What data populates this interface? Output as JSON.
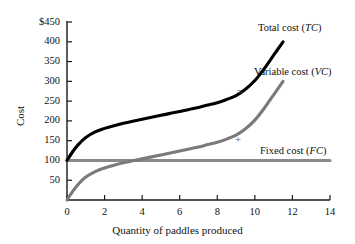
{
  "chart_data": {
    "type": "line",
    "title": "",
    "xlabel": "Quantity of paddles produced",
    "ylabel": "Cost",
    "xlim": [
      0,
      14
    ],
    "ylim": [
      0,
      450
    ],
    "grid": false,
    "legend_position": "inline-right",
    "x_ticks": [
      "0",
      "2",
      "4",
      "6",
      "8",
      "10",
      "12",
      "14"
    ],
    "x_tick_values": [
      0,
      2,
      4,
      6,
      8,
      10,
      12,
      14
    ],
    "y_ticks": [
      "50",
      "100",
      "150",
      "200",
      "250",
      "300",
      "350",
      "400",
      "$450"
    ],
    "y_tick_values": [
      50,
      100,
      150,
      200,
      250,
      300,
      350,
      400,
      450
    ],
    "series": [
      {
        "name": "Total cost (TC)",
        "abbr": "TC",
        "color": "#000000",
        "width": 3.1,
        "x": [
          0,
          0.3,
          0.6,
          1.0,
          1.5,
          2.0,
          2.5,
          3.0,
          3.5,
          4.0,
          4.5,
          5.0,
          5.5,
          6.0,
          6.5,
          7.0,
          7.5,
          8.0,
          8.5,
          9.0,
          9.5,
          10.0,
          10.5,
          11.0,
          11.5
        ],
        "values": [
          100,
          122,
          140,
          158,
          172,
          181,
          188,
          194,
          199,
          204,
          209,
          214,
          219,
          224,
          229,
          234,
          240,
          246,
          254,
          264,
          280,
          302,
          332,
          366,
          400
        ]
      },
      {
        "name": "Variable cost (VC)",
        "abbr": "VC",
        "color": "#7a7a7a",
        "width": 3.1,
        "x": [
          0,
          0.3,
          0.6,
          1.0,
          1.5,
          2.0,
          2.5,
          3.0,
          3.5,
          4.0,
          4.5,
          5.0,
          5.5,
          6.0,
          6.5,
          7.0,
          7.5,
          8.0,
          8.5,
          9.0,
          9.5,
          10.0,
          10.5,
          11.0,
          11.5
        ],
        "values": [
          0,
          22,
          40,
          58,
          72,
          81,
          88,
          94,
          99,
          104,
          109,
          114,
          119,
          124,
          129,
          134,
          140,
          146,
          154,
          164,
          180,
          202,
          232,
          266,
          300
        ]
      },
      {
        "name": "Fixed cost (FC)",
        "abbr": "FC",
        "color": "#8a8a8a",
        "width": 3.1,
        "x": [
          0,
          14
        ],
        "values": [
          100,
          100
        ]
      }
    ],
    "annotations": [
      {
        "text": "=",
        "x": 9.2,
        "y": 272
      },
      {
        "text": "+",
        "x": 9.1,
        "y": 152
      }
    ],
    "series_label_positions": [
      {
        "label": "Total cost (",
        "abbr": "TC",
        "close": ")",
        "left": 258,
        "top": 22
      },
      {
        "label": "Variable cost (",
        "abbr": "VC",
        "close": ")",
        "left": 254,
        "top": 66
      },
      {
        "label": "Fixed cost (",
        "abbr": "FC",
        "close": ")",
        "left": 260,
        "top": 145
      }
    ],
    "colors": {
      "axis": "#1a1a1a",
      "total_cost": "#000000",
      "variable_cost": "#7a7a7a",
      "fixed_cost": "#8a8a8a",
      "annotation": "#5a5a5a",
      "background": "#ffffff"
    }
  }
}
